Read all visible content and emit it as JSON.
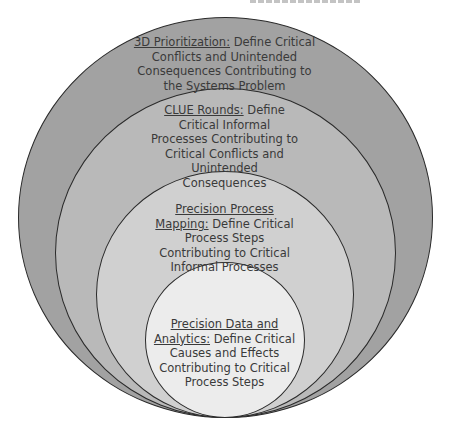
{
  "diagram": {
    "type": "nested-circles",
    "rings": [
      {
        "heading": "3D Prioritization:",
        "body": " Define Critical Conflicts and Unintended Consequences Contributing to the Systems Problem",
        "fill": "#a2a2a2"
      },
      {
        "heading": "CLUE Rounds:",
        "body": " Define Critical Informal Processes Contributing to Critical Conflicts and Unintended Consequences",
        "fill": "#b9b9b9"
      },
      {
        "heading": "Precision Process Mapping:",
        "body": " Define Critical Process Steps Contributing to Critical Informal Processes",
        "fill": "#d0d0d0"
      },
      {
        "heading": "Precision Data and Analytics:",
        "body": " Define Critical Causes and Effects Contributing to Critical Process Steps",
        "fill": "#ececec"
      }
    ],
    "stroke": "#2a2a2a"
  }
}
